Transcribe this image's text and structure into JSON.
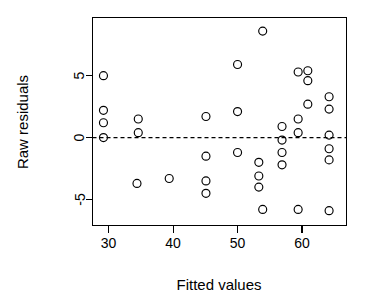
{
  "chart_data": {
    "type": "scatter",
    "title": "",
    "xlabel": "Fitted values",
    "ylabel": "Raw residuals",
    "xlim": [
      27.5,
      66.9
    ],
    "ylim": [
      -7.1,
      9.7
    ],
    "xticks": [
      30,
      40,
      50,
      60
    ],
    "xtick_labels": [
      "30",
      "40",
      "50",
      "60"
    ],
    "yticks": [
      5,
      0,
      -5
    ],
    "ytick_labels": [
      "5",
      "0",
      "-5"
    ],
    "grid": false,
    "legend": false,
    "reference_line": {
      "orientation": "horizontal",
      "y": 0,
      "style": "dashed",
      "color": "#000000"
    },
    "marker": {
      "shape": "open-circle",
      "radius_px": 4,
      "color": "#000000",
      "fill": "none"
    },
    "n_points": 36,
    "points": [
      {
        "x": 29.2,
        "y": 5.0
      },
      {
        "x": 29.2,
        "y": 2.2
      },
      {
        "x": 29.2,
        "y": 1.2
      },
      {
        "x": 29.2,
        "y": 0.0
      },
      {
        "x": 34.6,
        "y": 1.5
      },
      {
        "x": 34.6,
        "y": 0.4
      },
      {
        "x": 34.4,
        "y": -3.7
      },
      {
        "x": 39.4,
        "y": -3.3
      },
      {
        "x": 45.1,
        "y": 1.7
      },
      {
        "x": 45.1,
        "y": -1.5
      },
      {
        "x": 45.1,
        "y": -3.5
      },
      {
        "x": 45.1,
        "y": -4.5
      },
      {
        "x": 50.0,
        "y": 5.9
      },
      {
        "x": 50.0,
        "y": 2.1
      },
      {
        "x": 50.0,
        "y": -1.2
      },
      {
        "x": 53.9,
        "y": 8.6
      },
      {
        "x": 53.3,
        "y": -2.0
      },
      {
        "x": 53.3,
        "y": -3.1
      },
      {
        "x": 53.3,
        "y": -4.0
      },
      {
        "x": 53.9,
        "y": -5.8
      },
      {
        "x": 56.9,
        "y": 0.9
      },
      {
        "x": 56.9,
        "y": -0.2
      },
      {
        "x": 56.9,
        "y": -1.2
      },
      {
        "x": 56.9,
        "y": -2.2
      },
      {
        "x": 59.4,
        "y": 5.3
      },
      {
        "x": 59.4,
        "y": 1.5
      },
      {
        "x": 59.4,
        "y": 0.4
      },
      {
        "x": 59.4,
        "y": -5.8
      },
      {
        "x": 60.9,
        "y": 5.4
      },
      {
        "x": 60.9,
        "y": 4.6
      },
      {
        "x": 60.9,
        "y": 2.7
      },
      {
        "x": 64.2,
        "y": 3.3
      },
      {
        "x": 64.2,
        "y": 2.3
      },
      {
        "x": 64.2,
        "y": 0.2
      },
      {
        "x": 64.2,
        "y": -0.9
      },
      {
        "x": 64.2,
        "y": -1.8
      },
      {
        "x": 64.2,
        "y": -5.9
      }
    ]
  }
}
